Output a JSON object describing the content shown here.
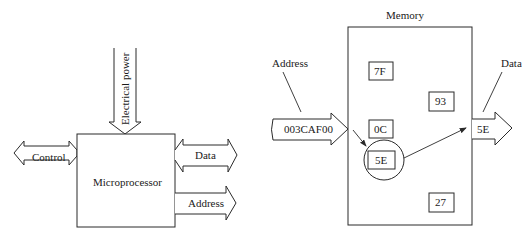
{
  "diagrams": {
    "microprocessor": {
      "block_label": "Microprocessor",
      "inputs": {
        "power_label": "Electrical power"
      },
      "buses": {
        "control": {
          "label": "Control",
          "direction": "bidirectional"
        },
        "data": {
          "label": "Data",
          "direction": "bidirectional"
        },
        "address": {
          "label": "Address",
          "direction": "output"
        }
      }
    },
    "memory": {
      "title": "Memory",
      "address_label": "Address",
      "address_value": "003CAF00",
      "data_label": "Data",
      "data_value": "5E",
      "cells": [
        {
          "value": "7F"
        },
        {
          "value": "93"
        },
        {
          "value": "0C"
        },
        {
          "value": "5E",
          "selected": true
        },
        {
          "value": "27"
        }
      ]
    }
  },
  "colors": {
    "line": "#2a2a2a",
    "background": "#ffffff"
  }
}
